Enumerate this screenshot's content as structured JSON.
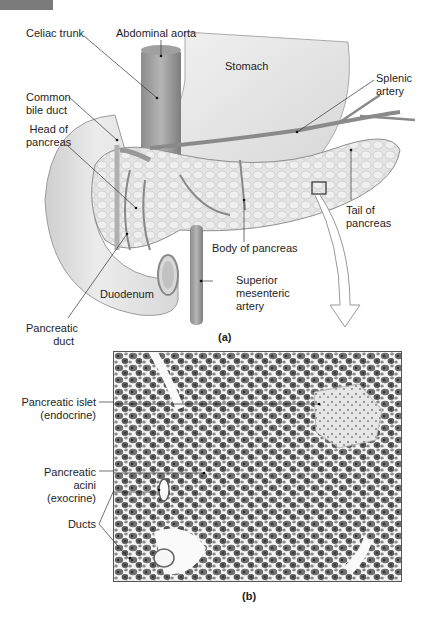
{
  "panel_a": {
    "label": "(a)",
    "labels": {
      "celiac_trunk": "Celiac trunk",
      "abdominal_aorta": "Abdominal aorta",
      "stomach": "Stomach",
      "splenic_artery_1": "Splenic",
      "splenic_artery_2": "artery",
      "common_bile_duct_1": "Common",
      "common_bile_duct_2": "bile duct",
      "head_of_pancreas_1": "Head of",
      "head_of_pancreas_2": "pancreas",
      "tail_of_pancreas_1": "Tail of",
      "tail_of_pancreas_2": "pancreas",
      "body_of_pancreas": "Body of pancreas",
      "duodenum": "Duodenum",
      "superior_mesenteric_1": "Superior",
      "superior_mesenteric_2": "mesenteric",
      "superior_mesenteric_3": "artery",
      "pancreatic_duct_1": "Pancreatic",
      "pancreatic_duct_2": "duct"
    }
  },
  "panel_b": {
    "label": "(b)",
    "labels": {
      "islet_1": "Pancreatic islet",
      "islet_2": "(endocrine)",
      "acini_1": "Pancreatic",
      "acini_2": "acini",
      "acini_3": "(exocrine)",
      "ducts": "Ducts"
    }
  }
}
